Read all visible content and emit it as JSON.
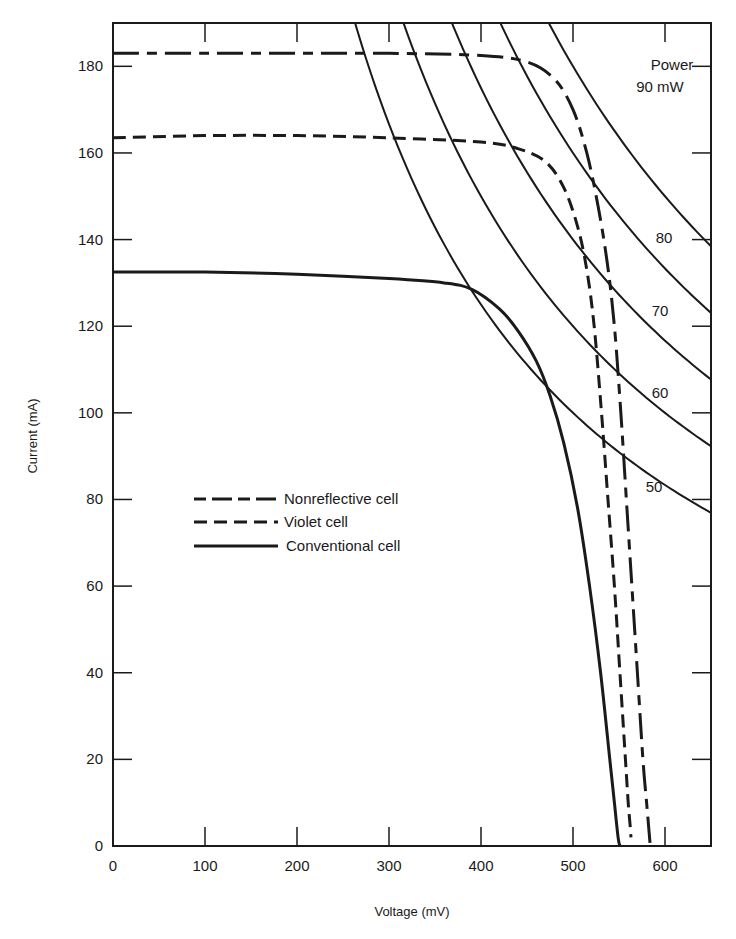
{
  "chart_data": {
    "type": "line",
    "title": "",
    "xlabel": "Voltage (mV)",
    "ylabel": "Current (mA)",
    "xlim": [
      0,
      650
    ],
    "ylim": [
      0,
      190
    ],
    "grid": false,
    "x_ticks": [
      0,
      100,
      200,
      300,
      400,
      500,
      600
    ],
    "y_ticks": [
      0,
      20,
      40,
      60,
      80,
      100,
      120,
      140,
      160,
      180
    ],
    "legend": {
      "position": "center-left",
      "entries": [
        {
          "label": "Nonreflective cell",
          "style": "long-dash"
        },
        {
          "label": "Violet cell",
          "style": "short-dash"
        },
        {
          "label": "Conventional cell",
          "style": "solid"
        }
      ]
    },
    "series": [
      {
        "name": "Nonreflective cell",
        "style": "long-dash",
        "points": [
          [
            0,
            183
          ],
          [
            100,
            183
          ],
          [
            200,
            183
          ],
          [
            300,
            183
          ],
          [
            400,
            182.5
          ],
          [
            450,
            181
          ],
          [
            480,
            177
          ],
          [
            500,
            170
          ],
          [
            515,
            160
          ],
          [
            527,
            148
          ],
          [
            537,
            135
          ],
          [
            545,
            120
          ],
          [
            552,
            100
          ],
          [
            558,
            80
          ],
          [
            564,
            60
          ],
          [
            570,
            40
          ],
          [
            576,
            20
          ],
          [
            580,
            10
          ],
          [
            582,
            5
          ],
          [
            584,
            0
          ]
        ]
      },
      {
        "name": "Violet cell",
        "style": "short-dash",
        "points": [
          [
            0,
            163.5
          ],
          [
            100,
            164
          ],
          [
            200,
            164
          ],
          [
            300,
            163.5
          ],
          [
            400,
            162.5
          ],
          [
            440,
            161
          ],
          [
            470,
            158
          ],
          [
            490,
            152
          ],
          [
            505,
            143
          ],
          [
            515,
            133
          ],
          [
            523,
            120
          ],
          [
            531,
            100
          ],
          [
            538,
            80
          ],
          [
            545,
            60
          ],
          [
            551,
            40
          ],
          [
            557,
            20
          ],
          [
            560,
            10
          ],
          [
            562,
            5
          ],
          [
            563,
            2
          ]
        ]
      },
      {
        "name": "Conventional cell",
        "style": "solid",
        "points": [
          [
            0,
            132.5
          ],
          [
            100,
            132.5
          ],
          [
            200,
            132
          ],
          [
            300,
            131
          ],
          [
            360,
            130
          ],
          [
            390,
            128.5
          ],
          [
            420,
            124
          ],
          [
            440,
            119
          ],
          [
            460,
            112
          ],
          [
            475,
            104
          ],
          [
            490,
            93
          ],
          [
            505,
            78
          ],
          [
            518,
            60
          ],
          [
            530,
            40
          ],
          [
            540,
            20
          ],
          [
            545,
            10
          ],
          [
            549,
            2
          ],
          [
            551,
            0
          ]
        ]
      }
    ],
    "power_curves": {
      "label_header": "Power",
      "unit": "mW",
      "values_mW": [
        50,
        60,
        70,
        80,
        90
      ],
      "labels": [
        "50",
        "60",
        "70",
        "80",
        "90 mW"
      ]
    },
    "annotations": [
      {
        "text": "Power",
        "x": 610,
        "y": 174
      },
      {
        "text": "90 mW",
        "x": 610,
        "y": 166
      },
      {
        "text": "80",
        "x": 610,
        "y": 141
      },
      {
        "text": "70",
        "x": 610,
        "y": 125
      },
      {
        "text": "60",
        "x": 610,
        "y": 104
      },
      {
        "text": "50",
        "x": 610,
        "y": 89
      }
    ]
  }
}
